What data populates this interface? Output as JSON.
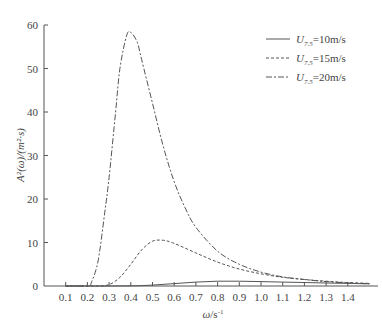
{
  "chart_data": {
    "type": "line",
    "title": "",
    "xlabel": "ω/s⁻¹",
    "ylabel": "A²(ω)/(m²·s)",
    "xlim": [
      0.0,
      1.5
    ],
    "ylim": [
      0,
      60
    ],
    "x_ticks": [
      "0.1",
      "0.2",
      "0.3",
      "0.4",
      "0.5",
      "0.6",
      "0.7",
      "0.8",
      "0.9",
      "1.0",
      "1.1",
      "1.2",
      "1.3",
      "1.4"
    ],
    "y_ticks": [
      "0",
      "10",
      "20",
      "30",
      "40",
      "50",
      "60"
    ],
    "grid": false,
    "legend_position": "upper right",
    "series": [
      {
        "name": "U7.5=10m/s",
        "style": "solid",
        "x": [
          0.1,
          0.2,
          0.3,
          0.4,
          0.5,
          0.6,
          0.7,
          0.8,
          0.9,
          1.0,
          1.1,
          1.2,
          1.3,
          1.4,
          1.5
        ],
        "values": [
          0,
          0,
          0,
          0.02,
          0.2,
          0.55,
          0.9,
          1.1,
          1.1,
          1.0,
          0.9,
          0.8,
          0.7,
          0.6,
          0.5
        ]
      },
      {
        "name": "U7.5=15m/s",
        "style": "dashed",
        "x": [
          0.1,
          0.2,
          0.25,
          0.3,
          0.35,
          0.4,
          0.45,
          0.5,
          0.55,
          0.6,
          0.7,
          0.8,
          0.9,
          1.0,
          1.1,
          1.2,
          1.3,
          1.4,
          1.5
        ],
        "values": [
          0,
          0,
          0,
          0.3,
          2.0,
          5.0,
          8.3,
          10.3,
          10.5,
          9.8,
          7.6,
          5.5,
          3.9,
          2.8,
          2.0,
          1.5,
          1.1,
          0.8,
          0.6
        ]
      },
      {
        "name": "U7.5=20m/s",
        "style": "dashdot",
        "x": [
          0.1,
          0.2,
          0.22,
          0.25,
          0.28,
          0.3,
          0.33,
          0.35,
          0.38,
          0.4,
          0.43,
          0.45,
          0.5,
          0.55,
          0.6,
          0.65,
          0.7,
          0.8,
          0.9,
          1.0,
          1.1,
          1.2,
          1.3,
          1.4,
          1.5
        ],
        "values": [
          0,
          0,
          1.0,
          6.0,
          17.0,
          25.0,
          40.0,
          50.0,
          57.5,
          58.3,
          56.0,
          52.0,
          42.0,
          32.0,
          24.0,
          18.0,
          13.5,
          8.0,
          5.0,
          3.2,
          2.1,
          1.5,
          1.0,
          0.7,
          0.5
        ]
      }
    ]
  },
  "legend": {
    "items": [
      {
        "label": "U7.5=10m/s",
        "prefix": "U",
        "sub": "7.5",
        "suffix": "=10m/s"
      },
      {
        "label": "U7.5=15m/s",
        "prefix": "U",
        "sub": "7.5",
        "suffix": "=15m/s"
      },
      {
        "label": "U7.5=20m/s",
        "prefix": "U",
        "sub": "7.5",
        "suffix": "=20m/s"
      }
    ]
  },
  "axes": {
    "xlabel_main": "ω",
    "xlabel_unit": "/s",
    "xlabel_exp": "-1",
    "ylabel": "A²(ω)/(m²·s)"
  },
  "colors": {
    "axis": "#555555",
    "line": "#555555"
  }
}
